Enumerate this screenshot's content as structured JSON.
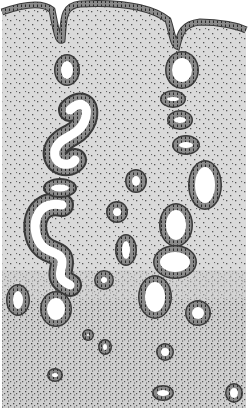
{
  "figure": {
    "colors": {
      "background": "#ffffff",
      "stroma_upper": "#d9d9d9",
      "stroma_lower": "#cfcfcf",
      "stroma_dots": "#555555",
      "epithelium": "#8a8a8a",
      "epithelium_outline": "#3a3a3a",
      "nuclei": "#2a2a2a",
      "lumen": "#ffffff"
    },
    "regions": [
      {
        "name": "surface-epithelium",
        "position": "top"
      },
      {
        "name": "functional-layer",
        "position": "upper"
      },
      {
        "name": "basal-layer",
        "position": "bottom",
        "denser_stroma": true
      }
    ],
    "glands": [
      {
        "id": "g1",
        "type": "round",
        "cx": 67,
        "cy": 70,
        "rx": 13,
        "ry": 16
      },
      {
        "id": "g2",
        "type": "lobed",
        "cx": 182,
        "cy": 70,
        "rx": 17,
        "ry": 19
      },
      {
        "id": "g3",
        "type": "oval",
        "cx": 173,
        "cy": 99,
        "rx": 13,
        "ry": 9
      },
      {
        "id": "g4",
        "type": "oval",
        "cx": 180,
        "cy": 120,
        "rx": 13,
        "ry": 10
      },
      {
        "id": "g5",
        "type": "oval",
        "cx": 186,
        "cy": 145,
        "rx": 14,
        "ry": 10
      },
      {
        "id": "g6",
        "type": "irregular",
        "cx": 205,
        "cy": 185,
        "rx": 17,
        "ry": 25
      },
      {
        "id": "g7",
        "type": "round",
        "cx": 136,
        "cy": 181,
        "rx": 11,
        "ry": 12
      },
      {
        "id": "g8",
        "type": "round",
        "cx": 117,
        "cy": 212,
        "rx": 11,
        "ry": 11
      },
      {
        "id": "g9",
        "type": "irregular",
        "cx": 176,
        "cy": 225,
        "rx": 17,
        "ry": 22
      },
      {
        "id": "g10",
        "type": "oval",
        "cx": 126,
        "cy": 250,
        "rx": 11,
        "ry": 16
      },
      {
        "id": "g11",
        "type": "oval",
        "cx": 175,
        "cy": 262,
        "rx": 22,
        "ry": 17
      },
      {
        "id": "g12",
        "type": "round",
        "cx": 104,
        "cy": 280,
        "rx": 10,
        "ry": 10
      },
      {
        "id": "g13",
        "type": "oval",
        "cx": 155,
        "cy": 297,
        "rx": 17,
        "ry": 22
      },
      {
        "id": "g14",
        "type": "oval",
        "cx": 18,
        "cy": 300,
        "rx": 12,
        "ry": 16
      },
      {
        "id": "g15",
        "type": "oval",
        "cx": 56,
        "cy": 309,
        "rx": 16,
        "ry": 18
      },
      {
        "id": "g16",
        "type": "round",
        "cx": 198,
        "cy": 313,
        "rx": 13,
        "ry": 13
      },
      {
        "id": "g17",
        "type": "small",
        "cx": 88,
        "cy": 335,
        "rx": 6,
        "ry": 6
      },
      {
        "id": "g18",
        "type": "small",
        "cx": 105,
        "cy": 347,
        "rx": 7,
        "ry": 8
      },
      {
        "id": "g19",
        "type": "small",
        "cx": 165,
        "cy": 352,
        "rx": 9,
        "ry": 9
      },
      {
        "id": "g20",
        "type": "small",
        "cx": 55,
        "cy": 375,
        "rx": 8,
        "ry": 7
      },
      {
        "id": "g21",
        "type": "small",
        "cx": 163,
        "cy": 393,
        "rx": 11,
        "ry": 8
      },
      {
        "id": "g22",
        "type": "small",
        "cx": 234,
        "cy": 393,
        "rx": 9,
        "ry": 10
      }
    ],
    "tortuous_glands": [
      {
        "id": "t1",
        "description": "coiled gland upper-left, y 100-180"
      },
      {
        "id": "t2",
        "description": "coiled gland left, y 195-290"
      }
    ]
  }
}
